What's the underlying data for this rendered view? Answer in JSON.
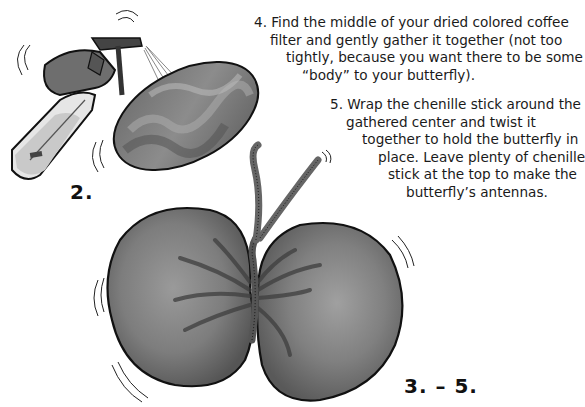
{
  "steps": [
    {
      "number": "4.",
      "lines": [
        "4. Find the middle of your dried colored coffee",
        "filter and gently gather it together (not too",
        "tightly, because you want there to be some",
        "“body” to your butterfly)."
      ]
    },
    {
      "number": "5.",
      "lines": [
        "5. Wrap the chenille stick around the",
        "gathered center and twist it",
        "together to hold the butterfly in",
        "place. Leave plenty of chenille",
        "stick at the top to make the",
        "butterfly’s antennas."
      ]
    }
  ],
  "figure_labels": {
    "spray": "2.",
    "butterfly": "3. – 5."
  },
  "illustrations": [
    {
      "name": "spray-bottle-hand",
      "description": "hand spraying water bottle onto coffee filter"
    },
    {
      "name": "wet-coffee-filter",
      "description": "oval colored coffee filter"
    },
    {
      "name": "finished-butterfly",
      "description": "coffee filter gathered with chenille stick antennas"
    }
  ],
  "colors": {
    "ink": "#111111",
    "wash_dark": "#5a5a5a",
    "wash_mid": "#8a8a8a",
    "wash_light": "#bdbdbd",
    "background": "#ffffff"
  }
}
